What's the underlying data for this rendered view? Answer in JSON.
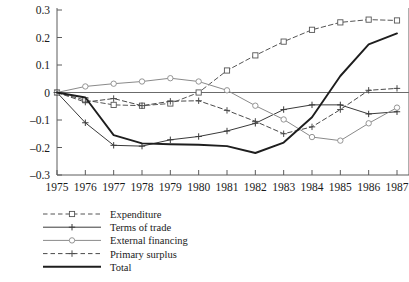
{
  "chart_data": {
    "type": "line",
    "title": "",
    "subtitle": "",
    "xlabel": "",
    "ylabel": "",
    "x": [
      1975,
      1976,
      1977,
      1978,
      1979,
      1980,
      1981,
      1982,
      1983,
      1984,
      1985,
      1986,
      1987
    ],
    "categories": [
      "1975",
      "1976",
      "1977",
      "1978",
      "1979",
      "1980",
      "1981",
      "1982",
      "1983",
      "1984",
      "1985",
      "1986",
      "1987"
    ],
    "xlim": [
      1975,
      1987
    ],
    "ylim": [
      -0.3,
      0.3
    ],
    "yticks": [
      0.3,
      0.2,
      0.1,
      0,
      -0.1,
      -0.2,
      -0.3
    ],
    "ytick_labels": [
      "0.3",
      "0.2",
      "0.1",
      "0",
      "–0.1",
      "–0.2",
      "–0.3"
    ],
    "xticks": [
      1975,
      1976,
      1977,
      1978,
      1979,
      1980,
      1981,
      1982,
      1983,
      1984,
      1985,
      1986,
      1987
    ],
    "xtick_labels": [
      "1975",
      "1976",
      "1977",
      "1978",
      "1979",
      "1980",
      "1981",
      "1982",
      "1983",
      "1984",
      "1985",
      "1986",
      "1987"
    ],
    "grid": false,
    "zero_line": true,
    "legend_position": "below-left",
    "series": [
      {
        "name": "Expenditure",
        "key": "expenditure",
        "style": "dashed",
        "marker": "open-square",
        "color": "#555555",
        "width": 1.0,
        "values": [
          0.0,
          -0.028,
          -0.045,
          -0.048,
          -0.04,
          0.0,
          0.08,
          0.135,
          0.185,
          0.228,
          0.255,
          0.265,
          0.262
        ]
      },
      {
        "name": "Terms of trade",
        "key": "terms_of_trade",
        "style": "solid",
        "marker": "plus",
        "color": "#3a3a3a",
        "width": 1.0,
        "values": [
          0.0,
          -0.11,
          -0.192,
          -0.195,
          -0.172,
          -0.16,
          -0.14,
          -0.112,
          -0.062,
          -0.045,
          -0.045,
          -0.078,
          -0.07
        ]
      },
      {
        "name": "External financing",
        "key": "external_financing",
        "style": "solid",
        "marker": "open-circle",
        "color": "#8a8a8a",
        "width": 1.0,
        "values": [
          0.0,
          0.022,
          0.032,
          0.04,
          0.052,
          0.04,
          0.008,
          -0.048,
          -0.098,
          -0.162,
          -0.175,
          -0.112,
          -0.055
        ]
      },
      {
        "name": "Primary surplus",
        "key": "primary_surplus",
        "style": "dashed",
        "marker": "plus",
        "color": "#4a4a4a",
        "width": 1.0,
        "values": [
          0.0,
          -0.035,
          -0.022,
          -0.048,
          -0.032,
          -0.03,
          -0.065,
          -0.105,
          -0.15,
          -0.125,
          -0.062,
          0.008,
          0.015
        ]
      },
      {
        "name": "Total",
        "key": "total",
        "style": "solid",
        "marker": "none",
        "color": "#1e1e1e",
        "width": 1.9,
        "values": [
          0.0,
          -0.018,
          -0.155,
          -0.185,
          -0.188,
          -0.19,
          -0.195,
          -0.22,
          -0.182,
          -0.09,
          0.06,
          0.175,
          0.215
        ]
      }
    ]
  },
  "legend": {
    "items": [
      {
        "label": "Expenditure",
        "style": "dashed",
        "marker": "open-square"
      },
      {
        "label": "Terms of trade",
        "style": "solid",
        "marker": "plus"
      },
      {
        "label": "External financing",
        "style": "solid",
        "marker": "open-circle"
      },
      {
        "label": "Primary surplus",
        "style": "dashed",
        "marker": "plus"
      },
      {
        "label": "Total",
        "style": "solid",
        "marker": "none"
      }
    ]
  }
}
